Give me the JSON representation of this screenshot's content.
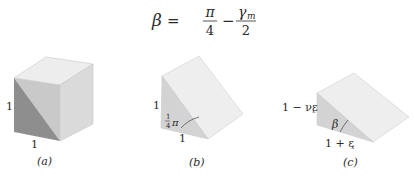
{
  "equation": {
    "lhs": "β",
    "equals": "=",
    "frac1_num": "π",
    "frac1_den": "4",
    "minus": "−",
    "frac2_num": "γ",
    "frac2_num_sub": "m",
    "frac2_den": "2"
  },
  "panels": [
    {
      "id": "a",
      "caption": "(a)",
      "shape": "cube",
      "labels": {
        "left_edge": "1",
        "bottom_edge": "1"
      }
    },
    {
      "id": "b",
      "caption": "(b)",
      "shape": "wedge",
      "labels": {
        "left_edge": "1",
        "bottom_edge": "1",
        "angle_num": "1",
        "angle_den": "4",
        "angle_sym": "π"
      }
    },
    {
      "id": "c",
      "caption": "(c)",
      "shape": "deformed-wedge",
      "labels": {
        "left_edge": "1 − νε",
        "left_edge_sub": "x",
        "bottom_edge": "1 + ε",
        "bottom_edge_sub": "x",
        "angle": "β"
      }
    }
  ],
  "colors": {
    "top_face": "#ececec",
    "right_face": "#d9d9d9",
    "front_dark": "#8f8f8f",
    "front_mid": "#c6c6c6",
    "wedge_slope": "#eeeeee",
    "wedge_side": "#d2d2d2",
    "edge": "#bdbdbd"
  }
}
